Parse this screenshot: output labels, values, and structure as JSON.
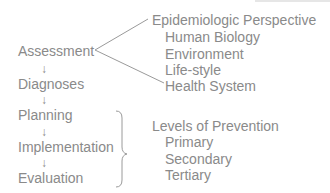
{
  "diagram": {
    "process_steps": [
      {
        "label": "Assessment"
      },
      {
        "label": "Diagnoses"
      },
      {
        "label": "Planning"
      },
      {
        "label": "Implementation"
      },
      {
        "label": "Evaluation"
      }
    ],
    "arrow_glyph": "↓",
    "epidemiologic": {
      "heading": "Epidemiologic Perspective",
      "items": [
        "Human Biology",
        "Environment",
        "Life-style",
        "Health System"
      ]
    },
    "prevention": {
      "heading": "Levels of Prevention",
      "items": [
        "Primary",
        "Secondary",
        "Tertiary"
      ]
    },
    "colors": {
      "text": "#8a8a8a",
      "line": "#9a9a9a"
    }
  }
}
